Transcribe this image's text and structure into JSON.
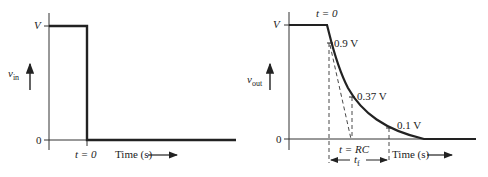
{
  "left_plot": {
    "y_label_main": "v",
    "y_label_sub": "in",
    "y_tick_top": "V",
    "y_tick_bottom": "0",
    "event_label": "t = 0",
    "x_label": "Time (s)"
  },
  "right_plot": {
    "y_label_main": "v",
    "y_label_sub": "out",
    "y_tick_top": "V",
    "y_tick_bottom": "0",
    "event_label": "t = 0",
    "annotation_90": "0.9 V",
    "annotation_37": "0.37 V",
    "annotation_10": "0.1 V",
    "time_constant_label": "t = RC",
    "fall_time_main": "t",
    "fall_time_sub": "f",
    "x_label": "Time (s)"
  },
  "colors": {
    "line": "#222222",
    "axis": "#333333"
  }
}
